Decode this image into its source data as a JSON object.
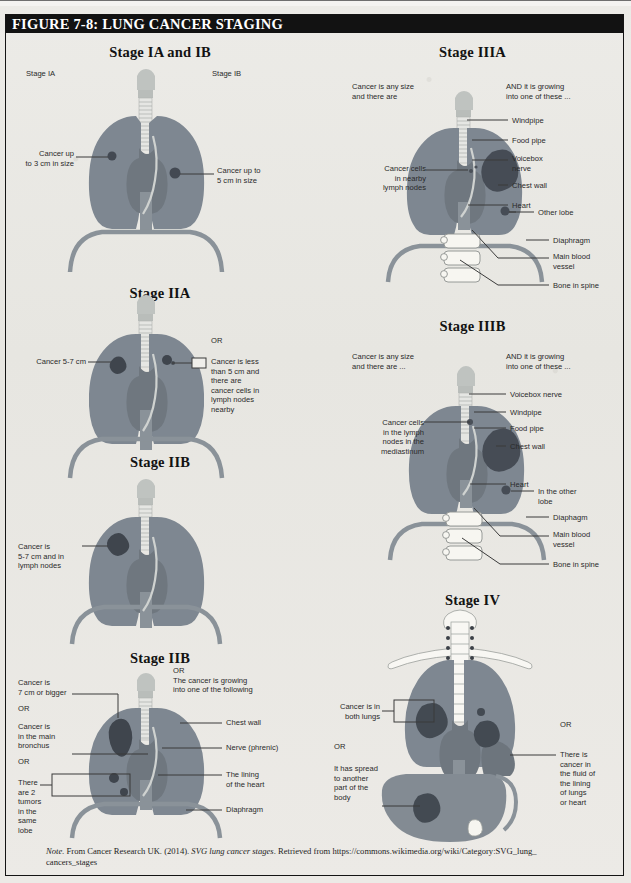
{
  "figure": {
    "title": "FIGURE 7-8: LUNG CANCER STAGING"
  },
  "note": {
    "label": "Note.",
    "text_before": " From Cancer Research UK. (2014). ",
    "italic_title": "SVG lung cancer stages",
    "text_after": ". Retrieved from https://commons.wikimedia.org/wiki/Category:SVG_lung_",
    "line2": "cancers_stages"
  },
  "colors": {
    "lung": "#7e8791",
    "lung_dark": "#6d767f",
    "tumor": "#4a5058",
    "tumor_dark": "#3c424a",
    "heart": "#8c949c",
    "airway": "#c9ccc9",
    "bone": "#f2f1ec",
    "liver": "#838b93",
    "background": "#e9e8e4",
    "header_bar": "#121212",
    "header_text": "#ffffff",
    "leader_line": "#3a3a3a",
    "label_text": "#2a2a2a"
  },
  "panels": [
    {
      "id": "stage-1a-1b",
      "title": "Stage IA and IB",
      "labels": [
        {
          "name": "stage-ia-caption",
          "text": "Stage IA"
        },
        {
          "name": "stage-ib-caption",
          "text": "Stage IB"
        },
        {
          "name": "cancer-3cm-label",
          "text": "Cancer up\nto 3 cm in size"
        },
        {
          "name": "cancer-5cm-label",
          "text": "Cancer up to\n5 cm in size"
        }
      ]
    },
    {
      "id": "stage-2a",
      "title": "Stage IIA",
      "labels": [
        {
          "name": "cancer-5-7cm-label",
          "text": "Cancer 5-7 cm"
        },
        {
          "name": "or-divider",
          "text": "OR"
        },
        {
          "name": "cancer-less-5cm-label",
          "text": "Cancer is less\nthan 5 cm and\nthere are\ncancer cells in\nlymph nodes\nnearby"
        }
      ]
    },
    {
      "id": "stage-2b-mid",
      "title": "Stage IIB",
      "labels": [
        {
          "name": "cancer-5-7cm-nodes-label",
          "text": "Cancer is\n5-7 cm and in\nlymph nodes"
        }
      ]
    },
    {
      "id": "stage-2b-bottom",
      "title": "Stage IIB",
      "labels": [
        {
          "name": "cancer-7cm-label",
          "text": "Cancer is\n7 cm or bigger"
        },
        {
          "name": "or-divider-1",
          "text": "OR"
        },
        {
          "name": "cancer-bronchus-label",
          "text": "Cancer is\nin the main\nbronchus"
        },
        {
          "name": "or-divider-2",
          "text": "OR"
        },
        {
          "name": "two-tumors-label",
          "text": "There\nare 2\ntumors\nin the\nsame lobe"
        },
        {
          "name": "or-growing-label",
          "text": "OR\nThe cancer is growing\ninto one of the following"
        },
        {
          "name": "chest-wall-label",
          "text": "Chest wall"
        },
        {
          "name": "nerve-phrenic-label",
          "text": "Nerve (phrenic)"
        },
        {
          "name": "lining-heart-label",
          "text": "The lining\nof the heart"
        },
        {
          "name": "diaphragm-label",
          "text": "Diaphragm"
        }
      ]
    },
    {
      "id": "stage-3a",
      "title": "Stage IIIA",
      "labels": [
        {
          "name": "any-size-label",
          "text": "Cancer is any size\nand there are"
        },
        {
          "name": "growing-into-label",
          "text": "AND it is growing\ninto one of these ..."
        },
        {
          "name": "cancer-cells-nodes-label",
          "text": "Cancer cells\nin nearby\nlymph nodes"
        },
        {
          "name": "windpipe-label",
          "text": "Windpipe"
        },
        {
          "name": "food-pipe-label",
          "text": "Food pipe"
        },
        {
          "name": "voicebox-nerve-label",
          "text": "Voicebox\nnerve"
        },
        {
          "name": "chest-wall-label",
          "text": "Chest wall"
        },
        {
          "name": "heart-label",
          "text": "Heart"
        },
        {
          "name": "other-lobe-label",
          "text": "Other lobe"
        },
        {
          "name": "diaphragm-label",
          "text": "Diaphragm"
        },
        {
          "name": "main-blood-vessel-label",
          "text": "Main blood\nvessel"
        },
        {
          "name": "bone-in-spine-label",
          "text": "Bone in spine"
        }
      ]
    },
    {
      "id": "stage-3b",
      "title": "Stage IIIB",
      "labels": [
        {
          "name": "any-size-label",
          "text": "Cancer is any size\nand there are ..."
        },
        {
          "name": "growing-into-label",
          "text": "AND it is growing\ninto one of these ..."
        },
        {
          "name": "cancer-cells-mediastinum-label",
          "text": "Cancer cells\nin the lymph\nnodes in the\nmediastinum"
        },
        {
          "name": "voicebox-nerve-label",
          "text": "Voicebox nerve"
        },
        {
          "name": "windpipe-label",
          "text": "Windpipe"
        },
        {
          "name": "food-pipe-label",
          "text": "Food pipe"
        },
        {
          "name": "chest-wall-label",
          "text": "Chest wall"
        },
        {
          "name": "heart-label",
          "text": "Heart"
        },
        {
          "name": "other-lobe-label",
          "text": "In the other\nlobe"
        },
        {
          "name": "diaphragm-label",
          "text": "Diaphagm"
        },
        {
          "name": "main-blood-vessel-label",
          "text": "Main blood\nvessel"
        },
        {
          "name": "bone-in-spine-label",
          "text": "Bone in spine"
        }
      ]
    },
    {
      "id": "stage-4",
      "title": "Stage IV",
      "labels": [
        {
          "name": "both-lungs-label",
          "text": "Cancer is in\nboth lungs"
        },
        {
          "name": "or-divider-left",
          "text": "OR"
        },
        {
          "name": "spread-label",
          "text": "It has spread\nto another\npart of the\nbody"
        },
        {
          "name": "or-divider-right",
          "text": "OR"
        },
        {
          "name": "fluid-lining-label",
          "text": "There is\ncancer in\nthe fluid of\nthe lining\nof lungs\nor heart"
        }
      ]
    }
  ]
}
